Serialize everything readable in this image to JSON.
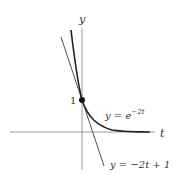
{
  "diagram": {
    "axes": {
      "x_label": "t",
      "y_label": "y"
    },
    "tick_label_y": "1",
    "curve": {
      "name": "exponential",
      "label_prefix": "y = e",
      "label_exponent": "−2t"
    },
    "tangent": {
      "name": "tangent line",
      "label": "y = −2t + 1"
    },
    "point": {
      "t": 0,
      "y": 1
    },
    "colors": {
      "axis": "#9a9a9a",
      "curve": "#222222",
      "tangent": "#555555",
      "text": "#333333"
    }
  }
}
